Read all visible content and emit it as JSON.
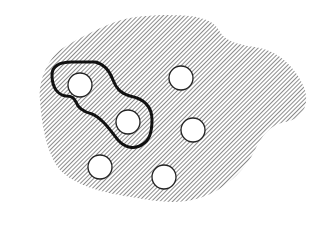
{
  "diagram": {
    "width": 322,
    "height": 225,
    "colors": {
      "background": "#ffffff",
      "hatch": "#6f6f6f",
      "outline": "#111111",
      "hole_fill": "#ffffff",
      "hole_stroke": "#222222"
    },
    "region": {
      "description": "hatched irregular blob region",
      "path": "M 40 100 C 38 80, 48 60, 60 50 C 75 40, 95 30, 115 22 C 135 15, 165 14, 190 16 C 205 18, 215 22, 220 32 C 226 42, 240 45, 260 48 C 280 52, 298 70, 305 90 C 310 110, 298 120, 285 122 C 270 125, 262 135, 255 150 C 245 170, 225 190, 200 198 C 175 206, 150 200, 125 196 C 100 192, 75 185, 60 170 C 48 155, 42 130, 40 100 Z"
    },
    "enclosure": {
      "description": "bold outlined sub-region enclosing two holes",
      "path": "M 52 75 C 52 65, 60 62, 72 62 L 95 62 C 105 64, 110 72, 113 80 C 116 88, 120 93, 130 96 C 145 99, 152 108, 152 120 C 152 132, 150 140, 143 144 C 135 150, 125 148, 118 140 C 110 130, 102 118, 92 114 C 84 112, 78 108, 76 102 C 74 98, 72 96, 66 96 C 58 95, 52 88, 52 75 Z"
    },
    "holes": [
      {
        "cx": 80,
        "cy": 85,
        "r": 12
      },
      {
        "cx": 128,
        "cy": 122,
        "r": 12
      },
      {
        "cx": 181,
        "cy": 78,
        "r": 12
      },
      {
        "cx": 193,
        "cy": 130,
        "r": 12
      },
      {
        "cx": 100,
        "cy": 167,
        "r": 12
      },
      {
        "cx": 164,
        "cy": 177,
        "r": 12
      }
    ]
  }
}
